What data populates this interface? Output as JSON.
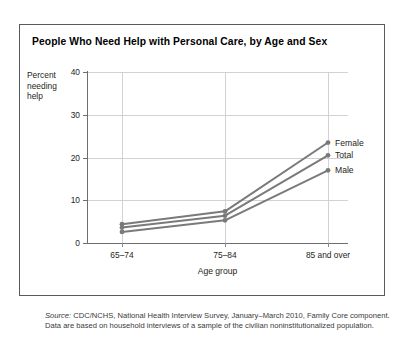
{
  "top_caption": "person who lives in a nursing home.",
  "figure": {
    "title": "People Who Need Help with Personal Care, by Age and Sex",
    "source_prefix": "Source:",
    "source_text": " CDC/NCHS, National Health Interview Survey, January–March 2010, Family Core component. Data are based on household interviews of a sample of the civilian noninstitutionalized population."
  },
  "chart_data": {
    "type": "line",
    "title": "People Who Need Help with Personal Care, by Age and Sex",
    "xlabel": "Age group",
    "ylabel": "Percent needing help",
    "ylabel_lines": [
      "Percent",
      "needing",
      "help"
    ],
    "categories": [
      "65–74",
      "75–84",
      "85 and over"
    ],
    "yticks": [
      0,
      10,
      20,
      30,
      40
    ],
    "ylim": [
      0,
      40
    ],
    "grid": true,
    "legend_position": "right-of-plot-endpoints",
    "markers": "filled-circle-at-data-points",
    "series": [
      {
        "name": "Female",
        "values": [
          4.4,
          7.4,
          23.5
        ],
        "color": "#7a7a7a"
      },
      {
        "name": "Total",
        "values": [
          3.6,
          6.4,
          20.5
        ],
        "color": "#7a7a7a"
      },
      {
        "name": "Male",
        "values": [
          2.6,
          5.3,
          17.0
        ],
        "color": "#7a7a7a"
      }
    ]
  },
  "colors": {
    "line": "#7a7a7a",
    "grid": "#d2d2d2",
    "axis": "#6e6e6e",
    "box_border": "#5a5a5a",
    "text": "#231f20"
  }
}
